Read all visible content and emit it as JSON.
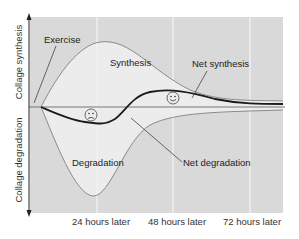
{
  "diagram": {
    "type": "collagen-turnover-after-exercise",
    "y_axis": {
      "upper_label": "Collage synthesis",
      "lower_label": "Collage degradation"
    },
    "x_axis": {
      "ticks": [
        "24 hours later",
        "48 hours later",
        "72 hours later"
      ]
    },
    "annotations": {
      "exercise": "Exercise",
      "synthesis": "Synthesis",
      "net_synthesis": "Net synthesis",
      "degradation": "Degradation",
      "net_degradation": "Net degradation"
    },
    "icons": {
      "sad_face": "sad-face-icon",
      "happy_face": "happy-face-icon"
    },
    "colors": {
      "background_band": "#d9d9d9",
      "inner_fill": "#ececec",
      "curve_outer": "#8a8a8a",
      "net_curve": "#1a1a1a",
      "baseline": "#777777",
      "gridline": "#f4f4f4"
    }
  }
}
